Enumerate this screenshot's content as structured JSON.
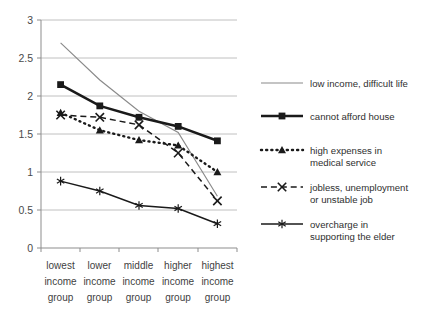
{
  "chart_data": {
    "type": "line",
    "title": "",
    "xlabel": "",
    "ylabel": "",
    "ylim": [
      0,
      3
    ],
    "ytick_values": [
      "0",
      "0.5",
      "1",
      "1.5",
      "2",
      "2.5",
      "3"
    ],
    "grid": true,
    "legend_position": "right",
    "categories": [
      "lowest income group",
      "lower income group",
      "middle income group",
      "higher income group",
      "highest income group"
    ],
    "category_lines": [
      [
        "lowest",
        "income",
        "group"
      ],
      [
        "lower",
        "income",
        "group"
      ],
      [
        "middle",
        "income",
        "group"
      ],
      [
        "higher",
        "income",
        "group"
      ],
      [
        "highest",
        "income",
        "group"
      ]
    ],
    "series": [
      {
        "name": "low income, difficult life",
        "marker": "none",
        "line_style": "solid",
        "color": "#8a8a8a",
        "values": [
          2.7,
          2.21,
          1.8,
          1.52,
          0.68
        ]
      },
      {
        "name": "cannot afford house",
        "marker": "square",
        "line_style": "solid",
        "color": "#1a1a1a",
        "values": [
          2.15,
          1.87,
          1.72,
          1.6,
          1.41
        ]
      },
      {
        "name": "high expenses in medical service",
        "name_lines": [
          "high expenses in",
          "medical service"
        ],
        "marker": "triangle",
        "line_style": "dotted",
        "color": "#1a1a1a",
        "values": [
          1.78,
          1.55,
          1.42,
          1.35,
          1.0
        ]
      },
      {
        "name": "jobless, unemployment or unstable job",
        "name_lines": [
          "jobless, unemployment",
          "or unstable job"
        ],
        "marker": "x",
        "line_style": "dashed",
        "color": "#1a1a1a",
        "values": [
          1.75,
          1.72,
          1.62,
          1.25,
          0.62
        ]
      },
      {
        "name": "overcharge in supporting the elder",
        "name_lines": [
          "overcharge in",
          "supporting the elder"
        ],
        "marker": "asterisk",
        "line_style": "solid",
        "color": "#1a1a1a",
        "values": [
          0.88,
          0.75,
          0.56,
          0.52,
          0.32
        ]
      }
    ]
  },
  "legend": {
    "entries": [
      {
        "label": "low income, difficult life",
        "line1": "low income, difficult life",
        "line2": ""
      },
      {
        "label": "cannot afford house",
        "line1": "cannot afford house",
        "line2": ""
      },
      {
        "label": "high expenses in medical service",
        "line1": "high expenses in",
        "line2": "medical service"
      },
      {
        "label": "jobless, unemployment or unstable job",
        "line1": "jobless, unemployment",
        "line2": "or unstable job"
      },
      {
        "label": "overcharge in supporting the elder",
        "line1": "overcharge in",
        "line2": "supporting the elder"
      }
    ]
  },
  "axis": {
    "y_ticks": [
      "3",
      "2.5",
      "2",
      "1.5",
      "1",
      "0.5",
      "0"
    ]
  }
}
